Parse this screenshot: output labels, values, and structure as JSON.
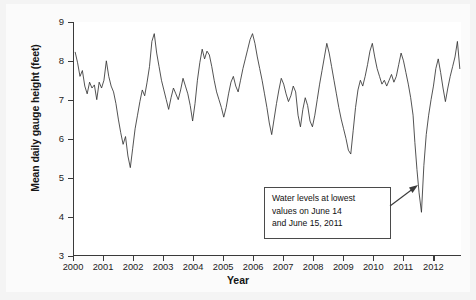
{
  "chart_data": {
    "type": "line",
    "title": "",
    "xlabel": "Year",
    "ylabel": "Mean daily gauge height (feet)",
    "xlim": [
      2000.0,
      2012.92
    ],
    "ylim": [
      3,
      9
    ],
    "ytick_labels": [
      "9",
      "8",
      "7",
      "6",
      "5",
      "4",
      "3"
    ],
    "ytick_values": [
      9,
      8,
      7,
      6,
      5,
      4,
      3
    ],
    "xtick_labels": [
      "2000",
      "2001",
      "2002",
      "2003",
      "2004",
      "2005",
      "2006",
      "2007",
      "2008",
      "2009",
      "2010",
      "2011",
      "2012"
    ],
    "xtick_values": [
      2000,
      2001,
      2002,
      2003,
      2004,
      2005,
      2006,
      2007,
      2008,
      2009,
      2010,
      2011,
      2012
    ],
    "grid": false,
    "legend": false,
    "line_color": "#333333",
    "series": [
      {
        "name": "Mean daily gauge height",
        "x": [
          2000.04,
          2000.12,
          2000.2,
          2000.28,
          2000.36,
          2000.44,
          2000.52,
          2000.6,
          2000.68,
          2000.76,
          2000.84,
          2000.92,
          2001.0,
          2001.08,
          2001.16,
          2001.24,
          2001.32,
          2001.4,
          2001.48,
          2001.56,
          2001.64,
          2001.72,
          2001.8,
          2001.88,
          2001.96,
          2002.04,
          2002.12,
          2002.2,
          2002.28,
          2002.36,
          2002.44,
          2002.52,
          2002.6,
          2002.68,
          2002.76,
          2002.84,
          2002.92,
          2003.0,
          2003.08,
          2003.16,
          2003.24,
          2003.32,
          2003.4,
          2003.48,
          2003.56,
          2003.64,
          2003.72,
          2003.8,
          2003.88,
          2003.96,
          2004.04,
          2004.12,
          2004.2,
          2004.28,
          2004.36,
          2004.44,
          2004.52,
          2004.6,
          2004.68,
          2004.76,
          2004.84,
          2004.92,
          2005.0,
          2005.08,
          2005.16,
          2005.24,
          2005.32,
          2005.4,
          2005.48,
          2005.56,
          2005.64,
          2005.72,
          2005.8,
          2005.88,
          2005.96,
          2006.04,
          2006.12,
          2006.2,
          2006.28,
          2006.36,
          2006.44,
          2006.52,
          2006.6,
          2006.68,
          2006.76,
          2006.84,
          2006.92,
          2007.0,
          2007.08,
          2007.16,
          2007.24,
          2007.32,
          2007.4,
          2007.48,
          2007.56,
          2007.64,
          2007.72,
          2007.8,
          2007.88,
          2007.96,
          2008.04,
          2008.12,
          2008.2,
          2008.28,
          2008.36,
          2008.44,
          2008.52,
          2008.6,
          2008.68,
          2008.76,
          2008.84,
          2008.92,
          2009.0,
          2009.08,
          2009.16,
          2009.24,
          2009.32,
          2009.4,
          2009.48,
          2009.56,
          2009.64,
          2009.72,
          2009.8,
          2009.88,
          2009.96,
          2010.04,
          2010.12,
          2010.2,
          2010.28,
          2010.36,
          2010.44,
          2010.52,
          2010.6,
          2010.68,
          2010.76,
          2010.84,
          2010.92,
          2011.0,
          2011.08,
          2011.16,
          2011.24,
          2011.32,
          2011.38,
          2011.45,
          2011.52,
          2011.6,
          2011.68,
          2011.76,
          2011.84,
          2011.92,
          2012.0,
          2012.08,
          2012.16,
          2012.24,
          2012.32,
          2012.4,
          2012.48,
          2012.56,
          2012.64,
          2012.72,
          2012.8,
          2012.88
        ],
        "values": [
          8.22,
          7.95,
          7.6,
          7.75,
          7.35,
          7.15,
          7.45,
          7.3,
          7.38,
          7.0,
          7.45,
          7.3,
          7.5,
          8.0,
          7.6,
          7.35,
          7.2,
          6.9,
          6.5,
          6.15,
          5.85,
          6.05,
          5.55,
          5.25,
          5.75,
          6.25,
          6.6,
          6.95,
          7.25,
          7.1,
          7.45,
          7.85,
          8.5,
          8.7,
          8.2,
          7.85,
          7.5,
          7.25,
          7.0,
          6.75,
          7.05,
          7.3,
          7.15,
          7.0,
          7.25,
          7.55,
          7.35,
          7.15,
          6.85,
          6.45,
          6.9,
          7.5,
          7.95,
          8.3,
          8.05,
          8.25,
          8.15,
          7.85,
          7.5,
          7.2,
          7.0,
          6.8,
          6.55,
          6.8,
          7.15,
          7.45,
          7.6,
          7.35,
          7.2,
          7.5,
          7.8,
          8.05,
          8.3,
          8.55,
          8.7,
          8.45,
          8.1,
          7.8,
          7.5,
          7.15,
          6.8,
          6.4,
          6.1,
          6.5,
          6.9,
          7.25,
          7.55,
          7.4,
          7.15,
          6.95,
          7.1,
          7.35,
          7.2,
          6.6,
          6.3,
          6.75,
          7.05,
          6.85,
          6.45,
          6.3,
          6.6,
          7.0,
          7.4,
          7.75,
          8.1,
          8.45,
          8.2,
          7.85,
          7.5,
          7.15,
          6.8,
          6.5,
          6.25,
          6.0,
          5.7,
          5.6,
          6.2,
          6.8,
          7.25,
          7.5,
          7.35,
          7.6,
          7.9,
          8.25,
          8.45,
          8.1,
          7.8,
          7.6,
          7.4,
          7.5,
          7.35,
          7.5,
          7.65,
          7.45,
          7.6,
          7.9,
          8.2,
          8.0,
          7.7,
          7.4,
          7.05,
          6.6,
          5.9,
          5.2,
          4.6,
          4.1,
          5.3,
          6.1,
          6.6,
          7.0,
          7.35,
          7.8,
          8.05,
          7.7,
          7.3,
          6.95,
          7.3,
          7.6,
          7.85,
          8.1,
          8.5,
          7.8
        ]
      }
    ],
    "annotations": [
      {
        "name": "lowest-values-callout",
        "lines": [
          "Water levels at lowest",
          "values on June 14",
          "and June 15, 2011"
        ],
        "points_to_x": 2011.6,
        "points_to_y": 4.1
      }
    ],
    "minimum": {
      "value": 4.1,
      "label": "June 14-15, 2011"
    }
  }
}
